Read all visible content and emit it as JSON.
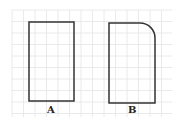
{
  "figure": {
    "grid": {
      "x0": 12,
      "y0": 10,
      "x1": 172,
      "y1": 117,
      "step": 11.5,
      "color": "#e4e4e4"
    },
    "shapes": [
      {
        "id": "A",
        "label": "A",
        "type": "rectangle"
      },
      {
        "id": "B",
        "label": "B",
        "type": "rectangle-rounded-top-right"
      }
    ],
    "stroke_color": "#333333"
  }
}
